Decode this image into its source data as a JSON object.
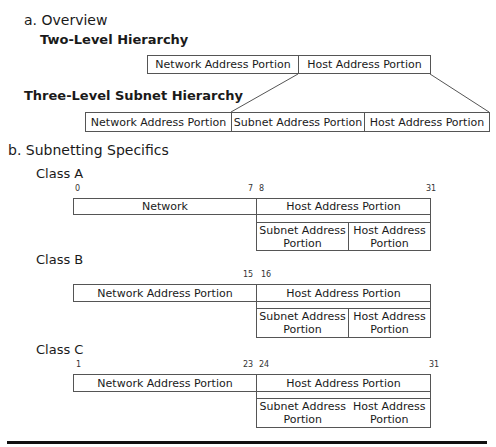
{
  "overview": {
    "heading": "a. Overview",
    "two_level": {
      "title": "Two-Level Hierarchy",
      "cells": [
        "Network  Address Portion",
        "Host Address Portion"
      ]
    },
    "three_level": {
      "title": "Three-Level Subnet Hierarchy",
      "cells": [
        "Network  Address Portion",
        "Subnet Address Portion",
        "Host Address Portion"
      ]
    }
  },
  "specifics": {
    "heading": "b. Subnetting Specifics",
    "classes": [
      {
        "name": "Class A",
        "bits": {
          "start": "0",
          "net_end": "7",
          "host_start": "8",
          "end": "31"
        },
        "network": "Network",
        "host": "Host Address Portion",
        "subnet": "Subnet Address Portion",
        "host_sub": "Host Address Portion"
      },
      {
        "name": "Class B",
        "bits": {
          "start": "",
          "net_end": "15",
          "host_start": "16",
          "end": ""
        },
        "network": "Network  Address Portion",
        "host": "Host Address Portion",
        "subnet": "Subnet Address Portion",
        "host_sub": "Host Address Portion"
      },
      {
        "name": "Class C",
        "bits": {
          "start": "1",
          "net_end": "23",
          "host_start": "24",
          "end": "31"
        },
        "network": "Network  Address Portion",
        "host": "Host Address Portion",
        "subnet": "Subnet Address Portion",
        "host_sub": "Host Address Portion"
      }
    ]
  }
}
